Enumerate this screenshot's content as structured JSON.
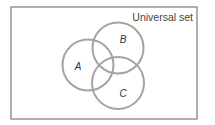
{
  "diagram": {
    "type": "venn",
    "universe": {
      "label": "Universal set",
      "x": 11,
      "y": 7,
      "width": 186,
      "height": 112,
      "stroke": "#7a7a7a"
    },
    "sets": [
      {
        "label": "A",
        "cx": 88,
        "cy": 65,
        "r": 25.5,
        "label_x": 78,
        "label_y": 70
      },
      {
        "label": "B",
        "cx": 118,
        "cy": 48,
        "r": 25.5,
        "label_x": 123,
        "label_y": 43
      },
      {
        "label": "C",
        "cx": 118,
        "cy": 83,
        "r": 26,
        "label_x": 123,
        "label_y": 97
      }
    ],
    "circle_stroke": "#a3a3a3"
  }
}
